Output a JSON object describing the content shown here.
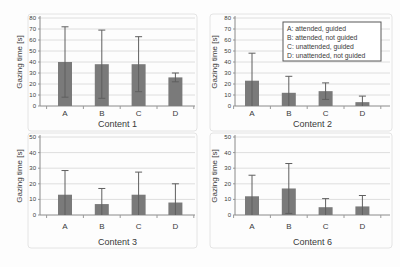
{
  "figure": {
    "ylabel": "Gazing time [s]",
    "categories": [
      "A",
      "B",
      "C",
      "D"
    ]
  },
  "legend": {
    "position": "top-right-of-content-2",
    "entries": [
      "A: attended, guided",
      "B: attended, not guided",
      "C: unattended, guided",
      "D: unattended, not guided"
    ]
  },
  "chart_data": [
    {
      "type": "bar",
      "xlabel": "Content 1",
      "ylabel": "Gazing time [s]",
      "categories": [
        "A",
        "B",
        "C",
        "D"
      ],
      "values": [
        40,
        38,
        38,
        26
      ],
      "errors": [
        32,
        31,
        25,
        4
      ],
      "ylim": [
        0,
        80
      ],
      "ytick_step": 10,
      "grid": true
    },
    {
      "type": "bar",
      "xlabel": "Content 2",
      "ylabel": "Gazing time [s]",
      "categories": [
        "A",
        "B",
        "C",
        "D"
      ],
      "values": [
        23,
        12,
        13.5,
        3.5
      ],
      "errors": [
        25,
        15,
        7.5,
        5.5
      ],
      "ylim": [
        0,
        80
      ],
      "ytick_step": 10,
      "grid": true,
      "has_legend": true
    },
    {
      "type": "bar",
      "xlabel": "Content 3",
      "ylabel": "Gazing time [s]",
      "categories": [
        "A",
        "B",
        "C",
        "D"
      ],
      "values": [
        13,
        7,
        13,
        8
      ],
      "errors": [
        15.5,
        10,
        14.5,
        12
      ],
      "ylim": [
        0,
        50
      ],
      "ytick_step": 10,
      "grid": true
    },
    {
      "type": "bar",
      "xlabel": "Content 6",
      "ylabel": "Gazing time [s]",
      "categories": [
        "A",
        "B",
        "C",
        "D"
      ],
      "values": [
        12,
        17,
        5,
        5.5
      ],
      "errors": [
        13.5,
        16,
        5.5,
        7
      ],
      "ylim": [
        0,
        50
      ],
      "ytick_step": 10,
      "grid": true
    }
  ],
  "colors": {
    "bar": "#7a7a7a",
    "error_bar": "#5f5f5f",
    "gridline": "#dedede",
    "axis": "#8a8a8a",
    "tick": "#9a9a9a",
    "text": "#3a3a3a",
    "panel_frame": "#e4e4e4",
    "legend_border": "#595959",
    "legend_fill": "#ffffff",
    "background": "#ffffff"
  }
}
